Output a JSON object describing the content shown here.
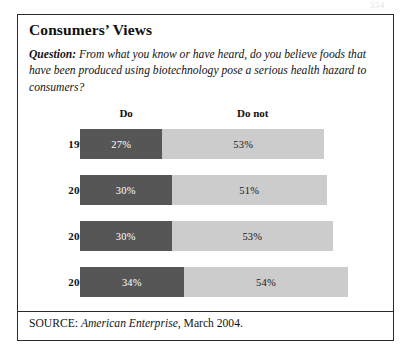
{
  "page_artifact": "334",
  "panel": {
    "title": "Consumers’ Views",
    "question_label": "Question:",
    "question_text": " From what you know or have heard, do you believe foods that have been produced using biotechnology pose a serious health hazard to consumers?",
    "source_prefix": "SOURCE: ",
    "source_publication": "American Enterprise",
    "source_suffix": ", March 2004."
  },
  "colors": {
    "do_segment": "#565656",
    "do_not_segment": "#cccccc",
    "border": "#2b2b2b",
    "text": "#141414"
  },
  "chart_data": {
    "type": "bar",
    "orientation": "horizontal",
    "stacked": true,
    "title": "Consumers’ Views",
    "xlabel": "",
    "ylabel": "",
    "categories": [
      "1999",
      "2000",
      "2001",
      "2002"
    ],
    "legend_position": "top",
    "grid": false,
    "series": [
      {
        "name": "Do",
        "values": [
          27,
          30,
          30,
          34
        ],
        "labels": [
          "27%",
          "30%",
          "30%",
          "34%"
        ],
        "color": "#565656"
      },
      {
        "name": "Do not",
        "values": [
          53,
          51,
          53,
          54
        ],
        "labels": [
          "53%",
          "51%",
          "53%",
          "54%"
        ],
        "color": "#cccccc"
      }
    ],
    "headers": [
      "Do",
      "Do not"
    ],
    "units": "percent",
    "xlim": [
      0,
      100
    ]
  }
}
